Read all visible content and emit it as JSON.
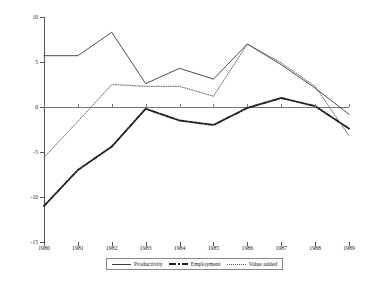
{
  "chart_data": {
    "type": "line",
    "title": "",
    "xlabel": "",
    "ylabel": "Percentage",
    "categories": [
      "1980",
      "1981",
      "1982",
      "1983",
      "1984",
      "1985",
      "1986",
      "1987",
      "1988",
      "1989"
    ],
    "x": [
      1980,
      1981,
      1982,
      1983,
      1984,
      1985,
      1986,
      1987,
      1988,
      1989
    ],
    "ylim": [
      -15,
      10
    ],
    "yticks": [
      10,
      5,
      0,
      -5,
      -10,
      -15
    ],
    "ytick_labels": [
      "10",
      "5",
      "0",
      "-5",
      "-10",
      "-15"
    ],
    "grid": false,
    "legend_position": "bottom",
    "zero_line": true,
    "series": [
      {
        "name": "Productivity",
        "style": "solid",
        "color": "#3a3a3a",
        "values": [
          5.7,
          5.7,
          8.3,
          2.6,
          4.3,
          3.1,
          7.0,
          4.7,
          2.1,
          -0.8
        ]
      },
      {
        "name": "Employment",
        "style": "dash-dot",
        "color": "#222222",
        "values": [
          -11.0,
          -7.0,
          -4.4,
          -0.2,
          -1.5,
          -2.0,
          -0.1,
          1.0,
          0.1,
          -2.4
        ]
      },
      {
        "name": "Value added",
        "style": "dotted",
        "color": "#555555",
        "values": [
          -5.6,
          -1.6,
          2.5,
          2.3,
          2.3,
          1.2,
          7.0,
          4.9,
          2.3,
          -3.2
        ]
      }
    ]
  },
  "legend": {
    "items": [
      {
        "label": "Productivity",
        "style": "solid"
      },
      {
        "label": "Employment",
        "style": "dash-dot"
      },
      {
        "label": "Value added",
        "style": "dotted"
      }
    ]
  },
  "axes": {
    "y_title": "Percentage"
  }
}
